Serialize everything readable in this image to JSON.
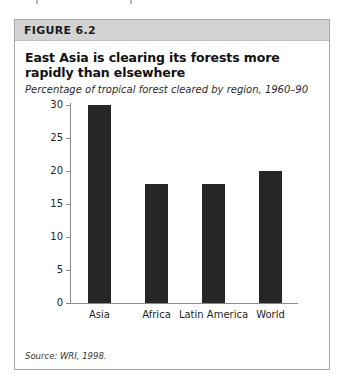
{
  "figure": {
    "header_label": "FIGURE 6.2",
    "title": "East Asia is clearing its forests more rapidly than elsewhere",
    "subtitle": "Percentage of tropical forest cleared by region, 1960–90",
    "source": "Source: WRI, 1998."
  },
  "colors": {
    "bar": "#262626",
    "header_band": "#d3d3d3",
    "frame_border": "#a8a8a8",
    "axis": "#8c8c8c",
    "page_background": "#ffffff"
  },
  "chart_data": {
    "type": "bar",
    "title": "East Asia is clearing its forests more rapidly than elsewhere",
    "subtitle": "Percentage of tropical forest cleared by region, 1960–90",
    "categories": [
      "Asia",
      "Africa",
      "Latin America",
      "World"
    ],
    "values": [
      30,
      18,
      18,
      20
    ],
    "xlabel": "",
    "ylabel": "",
    "ylim": [
      0,
      30
    ],
    "yticks": [
      0,
      5,
      10,
      15,
      20,
      25,
      30
    ],
    "ytick_labels": [
      "0",
      "5",
      "10",
      "15",
      "20",
      "25",
      "30"
    ],
    "grid": false,
    "legend": false,
    "source": "Source: WRI, 1998."
  }
}
